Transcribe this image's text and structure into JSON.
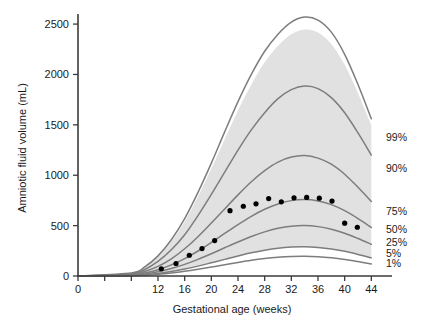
{
  "chart_data": {
    "type": "line",
    "title": "",
    "xlabel": "Gestational age (weeks)",
    "ylabel": "Amniotic fluid volume (mL)",
    "xlim": [
      0,
      45
    ],
    "ylim": [
      0,
      2600
    ],
    "grid": false,
    "legend_position": "right-inline",
    "xticks": [
      0,
      12,
      16,
      20,
      24,
      28,
      32,
      36,
      40,
      44
    ],
    "xticklabels": [
      "0",
      "12",
      "16",
      "20",
      "24",
      "28",
      "32",
      "36",
      "40",
      "44"
    ],
    "yticks": [
      0,
      500,
      1000,
      1500,
      2000,
      2500
    ],
    "yticklabels": [
      "0",
      "500",
      "1000",
      "1500",
      "2000",
      "2500"
    ],
    "shaded_band": {
      "label": "reference range shading",
      "color": "#dcdcdc",
      "lower_series": "5%",
      "upper_series": "99%_inner"
    },
    "x": [
      8,
      10,
      12,
      14,
      16,
      18,
      20,
      22,
      24,
      26,
      28,
      30,
      32,
      34,
      36,
      38,
      40,
      42,
      44
    ],
    "series": [
      {
        "name": "99%",
        "label": "99%",
        "color": "#7d7d7d",
        "values": [
          30,
          90,
          200,
          360,
          570,
          830,
          1120,
          1430,
          1730,
          2000,
          2230,
          2400,
          2520,
          2570,
          2540,
          2420,
          2200,
          1900,
          1560
        ]
      },
      {
        "name": "90%",
        "label": "90%",
        "color": "#7d7d7d",
        "values": [
          22,
          65,
          145,
          260,
          410,
          600,
          810,
          1030,
          1250,
          1450,
          1620,
          1760,
          1850,
          1885,
          1860,
          1770,
          1620,
          1420,
          1200
        ]
      },
      {
        "name": "75%",
        "label": "75%",
        "color": "#7d7d7d",
        "values": [
          15,
          45,
          95,
          170,
          270,
          390,
          525,
          665,
          805,
          935,
          1045,
          1130,
          1180,
          1195,
          1170,
          1110,
          1010,
          880,
          740
        ]
      },
      {
        "name": "50%",
        "label": "50%",
        "color": "#7d7d7d",
        "values": [
          10,
          30,
          62,
          110,
          172,
          248,
          333,
          422,
          510,
          592,
          662,
          715,
          748,
          758,
          745,
          708,
          648,
          570,
          482
        ]
      },
      {
        "name": "25%",
        "label": "25%",
        "color": "#7d7d7d",
        "values": [
          7,
          20,
          42,
          74,
          115,
          165,
          221,
          280,
          338,
          392,
          438,
          473,
          494,
          500,
          490,
          464,
          424,
          372,
          314
        ]
      },
      {
        "name": "5%",
        "label": "5%",
        "color": "#7d7d7d",
        "values": [
          4,
          12,
          25,
          44,
          69,
          98,
          131,
          165,
          199,
          230,
          256,
          276,
          288,
          291,
          284,
          269,
          245,
          214,
          180
        ]
      },
      {
        "name": "1%",
        "label": "1%",
        "color": "#7d7d7d",
        "values": [
          3,
          8,
          17,
          30,
          47,
          67,
          89,
          112,
          135,
          156,
          173,
          186,
          194,
          196,
          191,
          180,
          164,
          143,
          120
        ]
      }
    ],
    "scatter": {
      "name": "observed means",
      "color": "#000000",
      "points": [
        {
          "x": 12.5,
          "y": 72
        },
        {
          "x": 14.7,
          "y": 124
        },
        {
          "x": 16.7,
          "y": 206
        },
        {
          "x": 18.6,
          "y": 272
        },
        {
          "x": 20.5,
          "y": 352
        },
        {
          "x": 22.8,
          "y": 648
        },
        {
          "x": 24.8,
          "y": 692
        },
        {
          "x": 26.7,
          "y": 716
        },
        {
          "x": 28.6,
          "y": 768
        },
        {
          "x": 30.5,
          "y": 736
        },
        {
          "x": 32.4,
          "y": 776
        },
        {
          "x": 34.3,
          "y": 780
        },
        {
          "x": 36.2,
          "y": 772
        },
        {
          "x": 38.1,
          "y": 744
        },
        {
          "x": 40.0,
          "y": 524
        },
        {
          "x": 41.9,
          "y": 484
        }
      ]
    }
  },
  "axes": {
    "x_title": "Gestational age (weeks)",
    "y_title": "Amniotic fluid volume (mL)"
  },
  "percentile_labels": [
    {
      "text": "99%",
      "y_value": 1380
    },
    {
      "text": "90%",
      "y_value": 1070
    },
    {
      "text": "75%",
      "y_value": 650
    },
    {
      "text": "50%",
      "y_value": 465
    },
    {
      "text": "25%",
      "y_value": 340
    },
    {
      "text": "5%",
      "y_value": 228
    },
    {
      "text": "1%",
      "y_value": 125
    }
  ]
}
